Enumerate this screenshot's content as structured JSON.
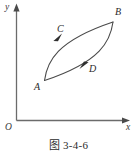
{
  "figure": {
    "caption": "图 3-4-6",
    "axes": {
      "y_label": "y",
      "x_label": "x",
      "origin_label": "O"
    },
    "points": [
      {
        "id": "A",
        "label": "A",
        "x": 44,
        "y": 80
      },
      {
        "id": "B",
        "label": "B",
        "x": 113,
        "y": 22
      },
      {
        "id": "C",
        "label": "C",
        "x": 59,
        "y": 38
      },
      {
        "id": "D",
        "label": "D",
        "x": 88,
        "y": 64
      }
    ],
    "paths": [
      {
        "id": "upper-path",
        "from": "A",
        "to": "B",
        "marker_at": "C",
        "direction": "A-to-B",
        "bulge": "left"
      },
      {
        "id": "lower-path",
        "from": "B",
        "to": "A",
        "marker_at": "D",
        "direction": "B-to-A",
        "bulge": "right"
      }
    ],
    "colors": {
      "axis": "#6b6b6b",
      "curve": "#4a4a4a",
      "label": "#2b2b2b",
      "background": "#ffffff"
    }
  }
}
